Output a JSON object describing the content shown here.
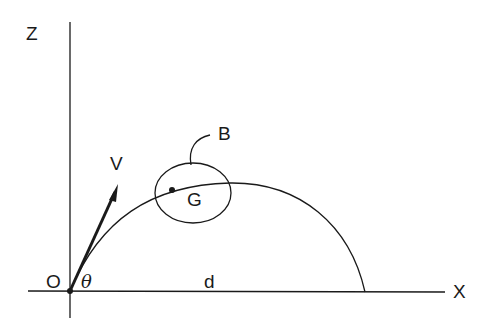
{
  "diagram": {
    "type": "projectile-trajectory",
    "axes": {
      "vertical_label": "Z",
      "horizontal_label": "X",
      "origin_label": "O"
    },
    "velocity": {
      "label": "V",
      "angle_label": "θ"
    },
    "range_label": "d",
    "body": {
      "label": "B",
      "center_of_mass_label": "G"
    },
    "colors": {
      "stroke": "#1a1a1a",
      "background": "#ffffff"
    }
  }
}
